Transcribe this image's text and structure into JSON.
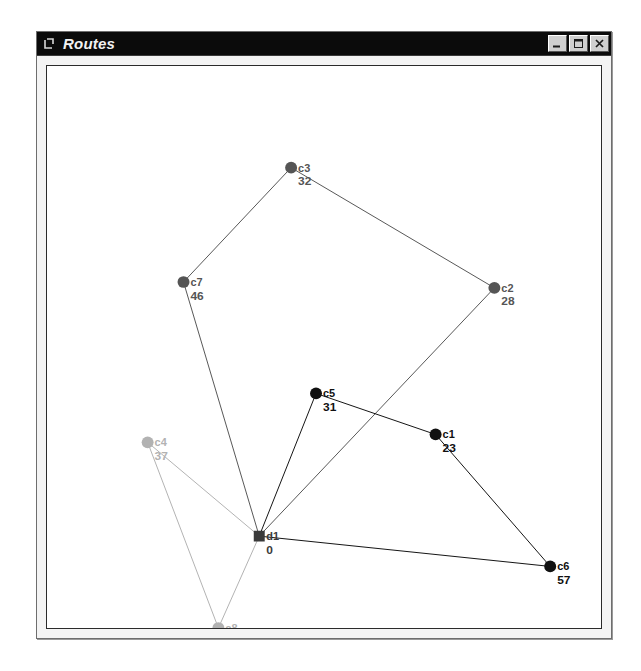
{
  "window": {
    "title": "Routes",
    "icon": "window-bracket-icon",
    "controls": [
      {
        "name": "minimize-button",
        "glyph": "minimize-icon",
        "label": "Minimize"
      },
      {
        "name": "maximize-button",
        "glyph": "maximize-icon",
        "label": "Maximize"
      },
      {
        "name": "close-button",
        "glyph": "close-icon",
        "label": "Close"
      }
    ]
  },
  "colors": {
    "titlebar_bg": "#0b0b0b",
    "titlebar_fg": "#f2f2f2",
    "client_bg": "#f4f4f4",
    "canvas_bg": "#ffffff",
    "canvas_border": "#2b2b2b",
    "route_1": "#555555",
    "route_2": "#111111",
    "route_3": "#b2b2b2",
    "depot": "#3a3a3a"
  },
  "chart_data": {
    "type": "scatter",
    "title": "Routes",
    "xlabel": "",
    "ylabel": "",
    "xlim": [
      0,
      556
    ],
    "ylim": [
      0,
      575
    ],
    "grid": false,
    "legend": null,
    "nodes": [
      {
        "id": "d1",
        "label": "d1",
        "demand": "0",
        "type": "depot",
        "shape": "square",
        "x": 213,
        "y": 481,
        "color": "#3a3a3a",
        "route": 0
      },
      {
        "id": "c1",
        "label": "c1",
        "demand": "23",
        "type": "customer",
        "shape": "circle",
        "x": 390,
        "y": 377,
        "color": "#111111",
        "route": 2
      },
      {
        "id": "c2",
        "label": "c2",
        "demand": "28",
        "type": "customer",
        "shape": "circle",
        "x": 449,
        "y": 227,
        "color": "#555555",
        "route": 1
      },
      {
        "id": "c3",
        "label": "c3",
        "demand": "32",
        "type": "customer",
        "shape": "circle",
        "x": 245,
        "y": 104,
        "color": "#555555",
        "route": 1
      },
      {
        "id": "c4",
        "label": "c4",
        "demand": "37",
        "type": "customer",
        "shape": "circle",
        "x": 101,
        "y": 385,
        "color": "#b2b2b2",
        "route": 3
      },
      {
        "id": "c5",
        "label": "c5",
        "demand": "31",
        "type": "customer",
        "shape": "circle",
        "x": 270,
        "y": 335,
        "color": "#111111",
        "route": 2
      },
      {
        "id": "c6",
        "label": "c6",
        "demand": "57",
        "type": "customer",
        "shape": "circle",
        "x": 505,
        "y": 512,
        "color": "#111111",
        "route": 2
      },
      {
        "id": "c7",
        "label": "c7",
        "demand": "46",
        "type": "customer",
        "shape": "circle",
        "x": 137,
        "y": 221,
        "color": "#555555",
        "route": 1
      },
      {
        "id": "c8",
        "label": "c8",
        "demand": "41",
        "type": "customer",
        "shape": "circle",
        "x": 172,
        "y": 575,
        "color": "#b2b2b2",
        "route": 3
      }
    ],
    "routes": [
      {
        "id": "route-1",
        "color": "#555555",
        "sequence": [
          "d1",
          "c7",
          "c3",
          "c2",
          "d1"
        ]
      },
      {
        "id": "route-2",
        "color": "#111111",
        "sequence": [
          "d1",
          "c5",
          "c1",
          "c6",
          "d1"
        ]
      },
      {
        "id": "route-3",
        "color": "#b2b2b2",
        "sequence": [
          "d1",
          "c4",
          "c8",
          "d1"
        ]
      }
    ]
  }
}
